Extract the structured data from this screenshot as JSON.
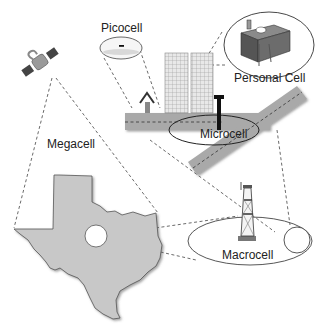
{
  "diagram": {
    "labels": {
      "picocell": "Picocell",
      "personal_cell": "Personal Cell",
      "megacell": "Megacell",
      "microcell": "Microcell",
      "macrocell": "Macrocell"
    },
    "elements": [
      {
        "name": "satellite-icon",
        "represents": "Megacell"
      },
      {
        "name": "texas-map",
        "represents": "Megacell coverage region"
      },
      {
        "name": "macrocell-tower-icon",
        "represents": "Macrocell"
      },
      {
        "name": "microcell-antenna-icon",
        "represents": "Microcell"
      },
      {
        "name": "picocell-device-icon",
        "represents": "Picocell"
      },
      {
        "name": "desk-icon",
        "represents": "Personal Cell"
      },
      {
        "name": "office-buildings-icon",
        "represents": "urban area"
      },
      {
        "name": "house-icon",
        "represents": "residence"
      }
    ],
    "colors": {
      "map_fill": "#c8c8c8",
      "road": "#a9a9a9",
      "line": "#333333",
      "background": "#ffffff"
    }
  }
}
